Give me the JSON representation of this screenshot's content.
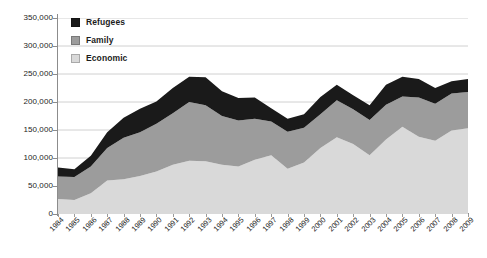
{
  "chart_data": {
    "type": "area",
    "stacked": true,
    "title": "",
    "subtitle": "",
    "xlabel": "",
    "ylabel": "",
    "grid": true,
    "legend_position": "top-left",
    "xlim": [
      1984,
      2009
    ],
    "ylim": [
      0,
      350000
    ],
    "ytick_step": 50000,
    "ytick_labels": [
      "350,000",
      "300,000",
      "250,000",
      "200,000",
      "150,000",
      "100,000",
      "50,000",
      "0"
    ],
    "ytick_values": [
      350000,
      300000,
      250000,
      200000,
      150000,
      100000,
      50000,
      0
    ],
    "categories": [
      "1984",
      "1985",
      "1986",
      "1987",
      "1988",
      "1989",
      "1990",
      "1991",
      "1992",
      "1993",
      "1994",
      "1995",
      "1996",
      "1997",
      "1998",
      "1999",
      "2000",
      "2001",
      "2002",
      "2003",
      "2004",
      "2005",
      "2006",
      "2007",
      "2008",
      "2009"
    ],
    "series": [
      {
        "name": "Economic",
        "color": "#d9d9d9",
        "values": [
          27000,
          25000,
          37000,
          60000,
          62000,
          68000,
          76000,
          88000,
          95000,
          94000,
          88000,
          85000,
          97000,
          105000,
          81000,
          92000,
          118000,
          137000,
          125000,
          105000,
          133000,
          156000,
          138000,
          131000,
          149000,
          153000
        ]
      },
      {
        "name": "Family",
        "color": "#9c9c9c",
        "values": [
          40000,
          41000,
          48000,
          58000,
          74000,
          78000,
          85000,
          92000,
          105000,
          100000,
          87000,
          82000,
          73000,
          60000,
          66000,
          62000,
          60000,
          66000,
          62000,
          63000,
          62000,
          54000,
          70000,
          66000,
          66000,
          65000
        ]
      },
      {
        "name": "Refugees",
        "color": "#1a1a1a",
        "values": [
          16000,
          14000,
          19000,
          28000,
          36000,
          42000,
          40000,
          45000,
          45000,
          50000,
          44000,
          40000,
          38000,
          24000,
          23000,
          24000,
          31000,
          28000,
          25000,
          26000,
          36000,
          35000,
          33000,
          28000,
          22000,
          23000
        ]
      }
    ]
  },
  "legend": {
    "entries": [
      {
        "label": "Refugees",
        "color": "#1a1a1a"
      },
      {
        "label": "Family",
        "color": "#9c9c9c"
      },
      {
        "label": "Economic",
        "color": "#d9d9d9"
      }
    ]
  },
  "axes": {
    "y_labels": [
      "350,000",
      "300,000",
      "250,000",
      "200,000",
      "150,000",
      "100,000",
      "50,000",
      "0"
    ],
    "x_labels": [
      "1984",
      "1985",
      "1986",
      "1987",
      "1988",
      "1989",
      "1990",
      "1991",
      "1992",
      "1993",
      "1994",
      "1995",
      "1996",
      "1997",
      "1998",
      "1999",
      "2000",
      "2001",
      "2002",
      "2003",
      "2004",
      "2005",
      "2006",
      "2007",
      "2008",
      "2009"
    ]
  },
  "colors": {
    "refugees": "#1a1a1a",
    "family": "#9c9c9c",
    "economic": "#d9d9d9",
    "gridline": "#d0d0d0",
    "axis": "#8c8c8c",
    "background": "#ffffff"
  }
}
